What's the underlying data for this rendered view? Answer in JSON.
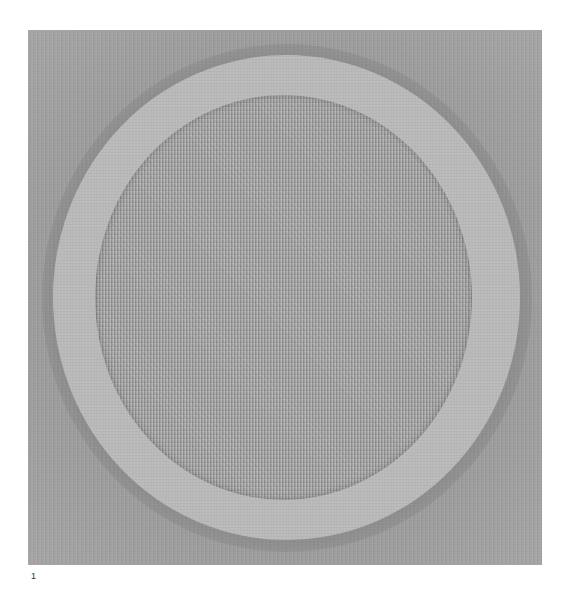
{
  "figure": {
    "caption_number": "1",
    "colors": {
      "background": "#ffffff",
      "plate": "#9b9b9b",
      "outer_ring": "#b9b9b9",
      "inner_disc": "#a2a2a2"
    }
  }
}
